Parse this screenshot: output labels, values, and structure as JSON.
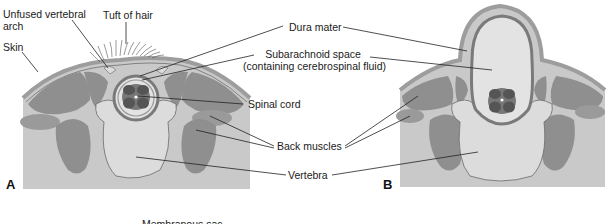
{
  "figure": {
    "panels": [
      {
        "id": "A",
        "label": "A"
      },
      {
        "id": "B",
        "label": "B"
      }
    ],
    "labels": {
      "unfused_arch_line1": "Unfused vertebral",
      "unfused_arch_line2": "arch",
      "tuft_of_hair": "Tuft of hair",
      "skin": "Skin",
      "dura_mater": "Dura mater",
      "subarachnoid_line1": "Subarachnoid space",
      "subarachnoid_line2": "(containing cerebrospinal fluid)",
      "spinal_cord": "Spinal cord",
      "back_muscles": "Back muscles",
      "vertebra": "Vertebra",
      "membranous_sac_cut": "Membranous sac"
    },
    "colors": {
      "background": "#ffffff",
      "tissue": "#c9c9c9",
      "skin": "#b5b5b5",
      "muscle": "#8f8f8f",
      "vertebra": "#dcdcdc",
      "dura": "#7a7a7a",
      "csf": "#e3e3e3",
      "cord_dark": "#555555",
      "cord_mid": "#777777",
      "leader": "#222222"
    }
  }
}
